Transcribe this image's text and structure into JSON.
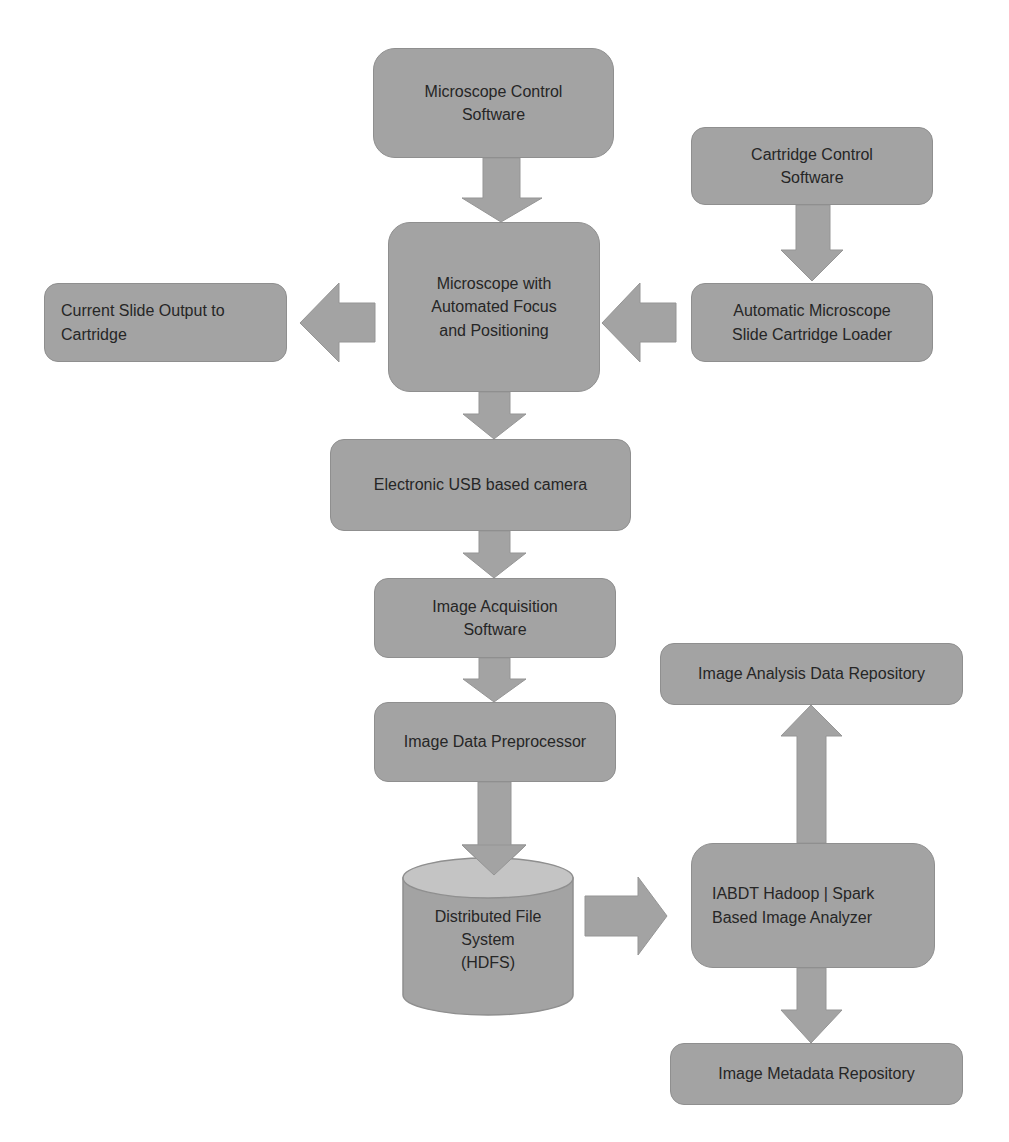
{
  "diagram": {
    "type": "flowchart",
    "colors": {
      "box_fill": "#a3a3a3",
      "box_border": "#8f8f8f",
      "arrow_fill": "#a3a3a3",
      "text": "#262626",
      "cylinder_top": "#c4c4c4",
      "background": "#ffffff"
    },
    "nodes": {
      "microscope_control": {
        "label": "Microscope Control\nSoftware"
      },
      "microscope_auto": {
        "label": "Microscope with\nAutomated Focus\nand Positioning"
      },
      "slide_output": {
        "label": "Current Slide Output to\nCartridge"
      },
      "cartridge_control": {
        "label": "Cartridge Control\nSoftware"
      },
      "cartridge_loader": {
        "label": "Automatic Microscope\nSlide Cartridge Loader"
      },
      "usb_camera": {
        "label": "Electronic USB based camera"
      },
      "image_acquisition": {
        "label": "Image Acquisition\nSoftware"
      },
      "preprocessor": {
        "label": "Image Data Preprocessor"
      },
      "hdfs": {
        "label": "Distributed File\nSystem\n(HDFS)",
        "shape": "cylinder"
      },
      "analyzer": {
        "label": "IABDT Hadoop | Spark\nBased Image Analyzer"
      },
      "analysis_repo": {
        "label": "Image Analysis Data Repository"
      },
      "metadata_repo": {
        "label": "Image Metadata Repository"
      }
    },
    "edges": [
      {
        "from": "microscope_control",
        "to": "microscope_auto",
        "direction": "down"
      },
      {
        "from": "cartridge_control",
        "to": "cartridge_loader",
        "direction": "down"
      },
      {
        "from": "cartridge_loader",
        "to": "microscope_auto",
        "direction": "left"
      },
      {
        "from": "microscope_auto",
        "to": "slide_output",
        "direction": "left"
      },
      {
        "from": "microscope_auto",
        "to": "usb_camera",
        "direction": "down"
      },
      {
        "from": "usb_camera",
        "to": "image_acquisition",
        "direction": "down"
      },
      {
        "from": "image_acquisition",
        "to": "preprocessor",
        "direction": "down"
      },
      {
        "from": "preprocessor",
        "to": "hdfs",
        "direction": "down"
      },
      {
        "from": "hdfs",
        "to": "analyzer",
        "direction": "right"
      },
      {
        "from": "analyzer",
        "to": "analysis_repo",
        "direction": "up"
      },
      {
        "from": "analyzer",
        "to": "metadata_repo",
        "direction": "down"
      }
    ]
  }
}
